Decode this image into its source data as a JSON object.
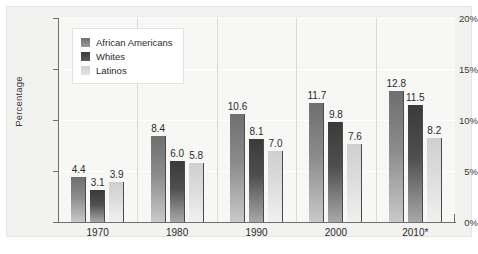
{
  "chart_data": {
    "type": "bar",
    "title": "",
    "xlabel": "",
    "ylabel": "Percentage",
    "ylim": [
      0,
      20
    ],
    "yticks": [
      "0%",
      "5%",
      "10%",
      "15%",
      "20%"
    ],
    "ytick_values": [
      0,
      5,
      10,
      15,
      20
    ],
    "grid": true,
    "legend_position": "top-left-inside",
    "categories": [
      "1970",
      "1980",
      "1990",
      "2000",
      "2010*"
    ],
    "series": [
      {
        "name": "African Americans",
        "color": "#8b8b8b",
        "values": [
          4.4,
          8.4,
          10.6,
          11.7,
          12.8
        ],
        "labels": [
          "4.4",
          "8.4",
          "10.6",
          "11.7",
          "12.8"
        ]
      },
      {
        "name": "Whites",
        "color": "#3a3a3a",
        "values": [
          3.1,
          6.0,
          8.1,
          9.8,
          11.5
        ],
        "labels": [
          "3.1",
          "6.0",
          "8.1",
          "9.8",
          "11.5"
        ]
      },
      {
        "name": "Latinos",
        "color": "#dcdcdc",
        "values": [
          3.9,
          5.8,
          7.0,
          7.6,
          8.2
        ],
        "labels": [
          "3.9",
          "5.8",
          "7.0",
          "7.6",
          "8.2"
        ]
      }
    ]
  },
  "legend": {
    "items": [
      {
        "label": "African Americans"
      },
      {
        "label": "Whites"
      },
      {
        "label": "Latinos"
      }
    ]
  }
}
